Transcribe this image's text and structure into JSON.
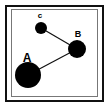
{
  "diagram": {
    "type": "node-link graph",
    "frame": {
      "outer_stroke": "#111111",
      "inner_stroke": "#777777",
      "background": "#ffffff"
    },
    "nodes": [
      {
        "id": "A",
        "label": "A",
        "cx": 28,
        "cy": 75,
        "r": 13,
        "label_x": 27,
        "label_y": 62,
        "label_size": 12
      },
      {
        "id": "B",
        "label": "B",
        "cx": 77,
        "cy": 49,
        "r": 9,
        "label_x": 78,
        "label_y": 37,
        "label_size": 9
      },
      {
        "id": "C",
        "label": "c",
        "cx": 41,
        "cy": 28,
        "r": 6,
        "label_x": 40,
        "label_y": 18,
        "label_size": 8
      }
    ],
    "edges": [
      {
        "from": "C",
        "to": "B"
      },
      {
        "from": "B",
        "to": "A"
      }
    ],
    "node_color": "#000000",
    "edge_color": "#111111"
  }
}
